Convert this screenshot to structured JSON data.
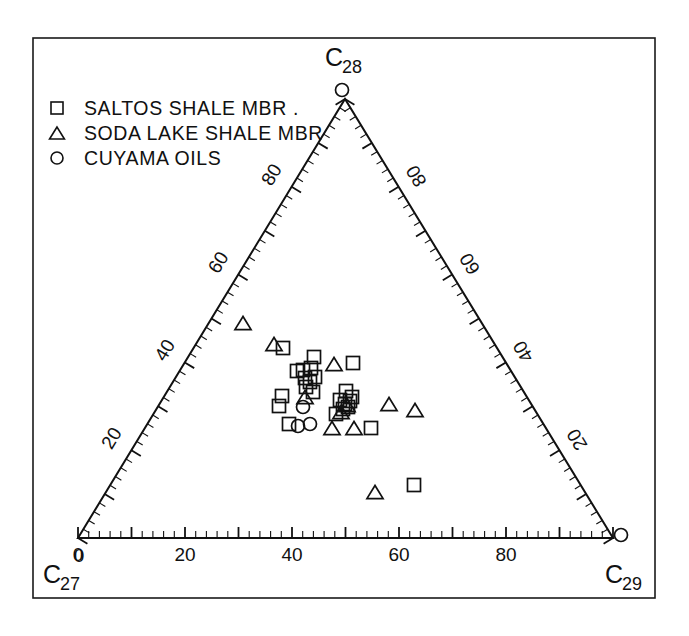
{
  "figure": {
    "kind": "ternary-scatter-diagram",
    "background_color": "#ffffff",
    "line_color": "#111111",
    "frame": {
      "x": 33,
      "y": 38,
      "width": 622,
      "height": 560
    }
  },
  "legend": {
    "entries": [
      {
        "marker": "square",
        "label": "SALTOS  SHALE MBR ."
      },
      {
        "marker": "triangle",
        "label": "SODA  LAKE  SHALE MBR"
      },
      {
        "marker": "circle",
        "label": "CUYAMA  OILS"
      }
    ]
  },
  "chart_data": {
    "type": "scatter",
    "subtype": "ternary",
    "title": "",
    "axes": {
      "bottom": {
        "name": "C27",
        "apex_label": "C",
        "apex_subscript": "27",
        "tick_labels": [
          "0",
          "20",
          "40",
          "60",
          "80"
        ],
        "tick_values": [
          0,
          20,
          40,
          60,
          80
        ],
        "major_interval": 10,
        "minor_interval": 2,
        "range": [
          0,
          100
        ]
      },
      "right": {
        "name": "C28",
        "apex_label": "C",
        "apex_subscript": "28",
        "tick_labels": [
          "20",
          "40",
          "60",
          "80"
        ],
        "tick_values": [
          20,
          40,
          60,
          80
        ],
        "major_interval": 10,
        "minor_interval": 2,
        "range": [
          0,
          100
        ]
      },
      "left": {
        "name": "C29",
        "apex_label": "C",
        "apex_subscript": "29",
        "tick_labels": [
          "20",
          "40",
          "60",
          "80"
        ],
        "tick_values": [
          20,
          40,
          60,
          80
        ],
        "major_interval": 10,
        "minor_interval": 2,
        "range": [
          0,
          100
        ]
      }
    },
    "apex_corner_labels": {
      "bottom_left": "0",
      "bottom_right": "0"
    },
    "grid": false,
    "legend_position": "top-left",
    "series": [
      {
        "name": "SALTOS  SHALE MBR .",
        "marker": "square",
        "points_px": [
          [
            283,
            348
          ],
          [
            314,
            357
          ],
          [
            297,
            371
          ],
          [
            303,
            370
          ],
          [
            311,
            368
          ],
          [
            305,
            378
          ],
          [
            310,
            382
          ],
          [
            315,
            377
          ],
          [
            306,
            387
          ],
          [
            282,
            396
          ],
          [
            279,
            406
          ],
          [
            313,
            392
          ],
          [
            346,
            391
          ],
          [
            340,
            400
          ],
          [
            345,
            404
          ],
          [
            350,
            401
          ],
          [
            343,
            409
          ],
          [
            348,
            407
          ],
          [
            352,
            397
          ],
          [
            353,
            363
          ],
          [
            289,
            424
          ],
          [
            371,
            428
          ],
          [
            414,
            485
          ],
          [
            336,
            414
          ]
        ]
      },
      {
        "name": "SODA  LAKE  SHALE MBR",
        "marker": "triangle",
        "points_px": [
          [
            243,
            323
          ],
          [
            274,
            344
          ],
          [
            334,
            364
          ],
          [
            305,
            397
          ],
          [
            347,
            405
          ],
          [
            341,
            412
          ],
          [
            389,
            404
          ],
          [
            415,
            410
          ],
          [
            332,
            428
          ],
          [
            354,
            428
          ],
          [
            375,
            492
          ]
        ]
      },
      {
        "name": "CUYAMA  OILS",
        "marker": "circle",
        "points_px": [
          [
            342,
            90
          ],
          [
            621,
            535
          ],
          [
            303,
            407
          ],
          [
            298,
            426
          ],
          [
            310,
            424
          ]
        ]
      }
    ],
    "counts": {
      "saltos_shale_squares": 24,
      "soda_lake_triangles": 11,
      "cuyama_circles": 5
    }
  }
}
